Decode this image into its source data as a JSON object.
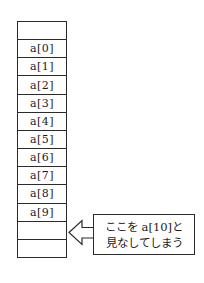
{
  "diagram": {
    "array_cells": [
      "",
      "a[0]",
      "a[1]",
      "a[2]",
      "a[3]",
      "a[4]",
      "a[5]",
      "a[6]",
      "a[7]",
      "a[8]",
      "a[9]",
      "",
      ""
    ],
    "callout": {
      "line1": "ここを a[10]と",
      "line2": "見なしてしまう"
    },
    "colors": {
      "line": "#2b2b2b",
      "text": "#1c1c1c",
      "background": "#ffffff"
    }
  }
}
